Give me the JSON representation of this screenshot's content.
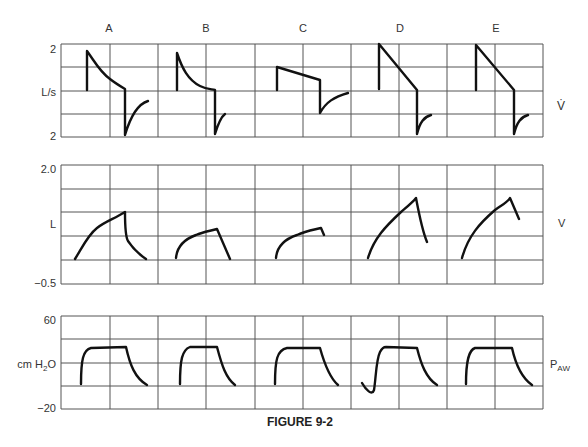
{
  "figure": {
    "caption": "FIGURE 9-2",
    "column_labels": [
      "A",
      "B",
      "C",
      "D",
      "E"
    ]
  },
  "panels": {
    "flow": {
      "y_top_label": "2",
      "y_mid_label": "L/s",
      "y_bottom_label": "2",
      "right_label": "V̇"
    },
    "volume": {
      "y_top_label": "2.0",
      "y_mid_label": "L",
      "y_bottom_label": "−0.5",
      "right_label": "V"
    },
    "pressure": {
      "y_top_label": "60",
      "y_mid_label_main": "cm H",
      "y_mid_label_sub": "2",
      "y_mid_label_tail": "O",
      "y_bottom_label": "−20",
      "right_label_main": "P",
      "right_label_sub": "AW"
    }
  },
  "chart_data": [
    {
      "type": "line",
      "title": "Flow (V̇) waveforms",
      "ylabel": "L/s",
      "ylim": [
        -2,
        2
      ],
      "series": [
        {
          "name": "A",
          "shape": "decelerating inspiratory flow, peak ~1.7 L/s, decays to ~0 then expiratory peak ~-1.9 L/s recovering to ~-0.8"
        },
        {
          "name": "B",
          "shape": "decelerating inspiratory flow, peak ~1.6 L/s, decays to 0; expiratory peak ~-1.9 L/s short recovery to ~-1.0"
        },
        {
          "name": "C",
          "shape": "slightly descending ramp from ~1.0 to ~0.6 L/s; expiratory peak ~-1.0 L/s recovering to ~-0.1"
        },
        {
          "name": "D",
          "shape": "linear descending ramp from ~2.0 to ~0 L/s; expiratory peak ~-1.9 L/s recovering to ~-1.0"
        },
        {
          "name": "E",
          "shape": "linear descending ramp from ~1.9 to ~0 L/s; expiratory peak ~-1.9 L/s recovering to ~-1.0"
        }
      ]
    },
    {
      "type": "line",
      "title": "Volume (V) waveforms",
      "ylabel": "L",
      "ylim": [
        -0.5,
        2.0
      ],
      "series": [
        {
          "name": "A",
          "peak_volume": 1.0,
          "returns_to": 0.0
        },
        {
          "name": "B",
          "peak_volume": 0.6,
          "returns_to": 0.0
        },
        {
          "name": "C",
          "peak_volume": 0.6,
          "returns_to": 0.5
        },
        {
          "name": "D",
          "peak_volume": 1.4,
          "returns_to": 0.4
        },
        {
          "name": "E",
          "peak_volume": 1.4,
          "returns_to": 1.0
        }
      ]
    },
    {
      "type": "line",
      "title": "Airway pressure (PAW) waveforms",
      "ylabel": "cm H2O",
      "ylim": [
        -20,
        60
      ],
      "series": [
        {
          "name": "A",
          "plateau": 30,
          "baseline": 0
        },
        {
          "name": "B",
          "plateau": 30,
          "baseline": 0
        },
        {
          "name": "C",
          "plateau": 30,
          "baseline": 0
        },
        {
          "name": "D",
          "plateau": 30,
          "baseline": 0,
          "initial_dip": -7
        },
        {
          "name": "E",
          "plateau": 30,
          "baseline": 0
        }
      ]
    }
  ]
}
